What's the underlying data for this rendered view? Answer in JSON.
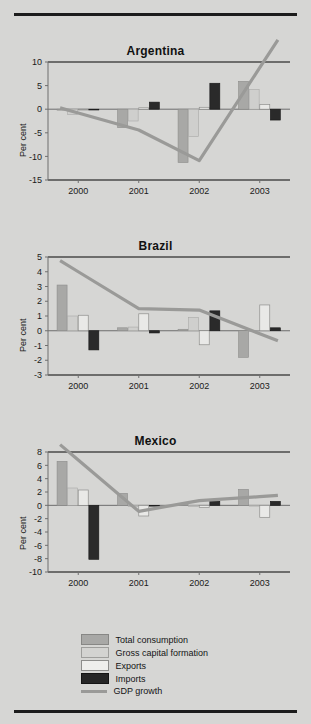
{
  "figure": {
    "ylabel": "Per cent",
    "series_names": [
      "Total consumption",
      "Gross capital formation",
      "Exports",
      "Imports",
      "GDP growth"
    ],
    "colors": {
      "total_consumption": "#a8a8a6",
      "gross_capital_formation": "#cfcfcd",
      "exports": "#e9e9e7",
      "imports": "#2a2a2a",
      "gdp_growth": "#9a9a98",
      "background": "#d6d6d4",
      "rule": "#1c1c1c"
    }
  },
  "legend": {
    "items": [
      {
        "label": "Total consumption",
        "swatch": "total-consumption-swatch"
      },
      {
        "label": "Gross capital formation",
        "swatch": "gross-capital-formation-swatch"
      },
      {
        "label": "Exports",
        "swatch": "exports-swatch"
      },
      {
        "label": "Imports",
        "swatch": "imports-swatch"
      },
      {
        "label": "GDP growth",
        "swatch": "gdp-growth-swatch"
      }
    ]
  },
  "chart_data": [
    {
      "type": "bar",
      "title": "Argentina",
      "xlabel": "",
      "ylabel": "Per cent",
      "categories": [
        "2000",
        "2001",
        "2002",
        "2003"
      ],
      "ylim": [
        -15,
        10
      ],
      "yticks": [
        10,
        5,
        0,
        -5,
        -10,
        -15
      ],
      "grid": false,
      "legend_position": "bottom-shared",
      "series": [
        {
          "name": "Total consumption",
          "values": [
            -0.2,
            -3.9,
            -11.3,
            5.9
          ]
        },
        {
          "name": "Gross capital formation",
          "values": [
            -1.1,
            -2.5,
            -5.8,
            4.2
          ]
        },
        {
          "name": "Exports",
          "values": [
            0.0,
            0.3,
            0.4,
            1.0
          ]
        },
        {
          "name": "Imports",
          "values": [
            0.0,
            1.5,
            5.5,
            -2.3
          ]
        }
      ],
      "overlay": {
        "name": "GDP growth",
        "type": "line",
        "x": [
          "2000",
          "2001",
          "2002",
          "2003"
        ],
        "values": [
          -0.8,
          -4.4,
          -10.9,
          8.8
        ]
      }
    },
    {
      "type": "bar",
      "title": "Brazil",
      "xlabel": "",
      "ylabel": "Per cent",
      "categories": [
        "2000",
        "2001",
        "2002",
        "2003"
      ],
      "ylim": [
        -3,
        5
      ],
      "yticks": [
        5,
        4,
        3,
        2,
        1,
        0,
        -1,
        -2,
        -3
      ],
      "grid": false,
      "legend_position": "bottom-shared",
      "series": [
        {
          "name": "Total consumption",
          "values": [
            3.1,
            0.2,
            0.1,
            -1.8
          ]
        },
        {
          "name": "Gross capital formation",
          "values": [
            1.0,
            0.25,
            0.9,
            0.0
          ]
        },
        {
          "name": "Exports",
          "values": [
            1.05,
            1.15,
            -0.95,
            1.75
          ]
        },
        {
          "name": "Imports",
          "values": [
            -1.3,
            -0.15,
            1.35,
            0.2
          ]
        }
      ],
      "overlay": {
        "name": "GDP growth",
        "type": "line",
        "x": [
          "2000",
          "2001",
          "2002",
          "2003"
        ],
        "values": [
          4.0,
          1.5,
          1.4,
          -0.2
        ]
      }
    },
    {
      "type": "bar",
      "title": "Mexico",
      "xlabel": "",
      "ylabel": "Per cent",
      "categories": [
        "2000",
        "2001",
        "2002",
        "2003"
      ],
      "ylim": [
        -10,
        8
      ],
      "yticks": [
        8,
        6,
        4,
        2,
        0,
        -2,
        -4,
        -6,
        -8,
        -10
      ],
      "grid": false,
      "legend_position": "bottom-shared",
      "series": [
        {
          "name": "Total consumption",
          "values": [
            6.6,
            1.8,
            0.1,
            2.4
          ]
        },
        {
          "name": "Gross capital formation",
          "values": [
            2.6,
            -0.2,
            -0.2,
            0.0
          ]
        },
        {
          "name": "Exports",
          "values": [
            2.3,
            -1.6,
            -0.3,
            -1.8
          ]
        },
        {
          "name": "Imports",
          "values": [
            -8.1,
            0.0,
            0.6,
            0.6
          ]
        }
      ],
      "overlay": {
        "name": "GDP growth",
        "type": "line",
        "x": [
          "2000",
          "2001",
          "2002",
          "2003"
        ],
        "values": [
          6.8,
          -0.9,
          0.7,
          1.3
        ]
      }
    }
  ]
}
